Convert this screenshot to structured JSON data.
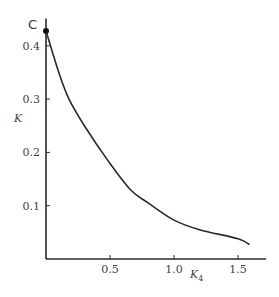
{
  "chart_data": {
    "type": "line",
    "title": "",
    "xlabel": "K4",
    "xlabel_main": "K",
    "xlabel_sub": "4",
    "ylabel": "K",
    "xlim": [
      0,
      1.72
    ],
    "ylim": [
      0,
      0.44
    ],
    "grid": false,
    "legend": null,
    "x_ticks": [
      0.5,
      1.0,
      1.5
    ],
    "x_tick_labels": [
      "0.5",
      "1.0",
      "1.5"
    ],
    "y_ticks": [
      0.1,
      0.2,
      0.3,
      0.4
    ],
    "y_tick_labels": [
      "0.1",
      "0.2",
      "0.3",
      "0.4"
    ],
    "series": [
      {
        "name": "K vs K4",
        "x": [
          0.0,
          0.1,
          0.18,
          0.3,
          0.48,
          0.66,
          0.8,
          1.0,
          1.2,
          1.5,
          1.59
        ],
        "y": [
          0.428,
          0.35,
          0.3,
          0.25,
          0.186,
          0.13,
          0.105,
          0.073,
          0.055,
          0.038,
          0.027
        ]
      }
    ],
    "annotations": [
      {
        "text": "C",
        "x": 0.0,
        "y": 0.428,
        "marker": "filled-circle"
      }
    ]
  }
}
